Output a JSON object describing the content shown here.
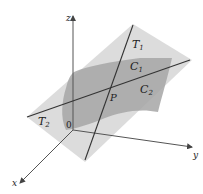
{
  "diagram": {
    "axes": {
      "z_label": "z",
      "y_label": "y",
      "x_label": "x",
      "origin_label": "0"
    },
    "labels": {
      "tangent_line_1": "T",
      "tangent_line_1_sub": "1",
      "tangent_line_2": "T",
      "tangent_line_2_sub": "2",
      "curve_1": "C",
      "curve_1_sub": "1",
      "curve_2": "C",
      "curve_2_sub": "2",
      "point": "P"
    },
    "colors": {
      "tangent_plane": "#d4d4d4",
      "surface": "#a9a9a9",
      "lines": "#333333",
      "axes": "#555555"
    }
  }
}
